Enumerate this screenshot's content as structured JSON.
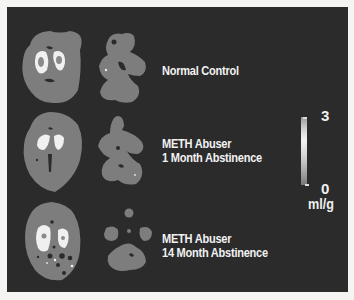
{
  "figure": {
    "background_color": "#2b2b2b",
    "tissue_color": "#7d7d7d",
    "high_uptake_color": "#f5f5f5",
    "rows": [
      {
        "label_line1": "Normal Control",
        "label_line2": ""
      },
      {
        "label_line1": "METH Abuser",
        "label_line2": "1 Month Abstinence"
      },
      {
        "label_line1": "METH Abuser",
        "label_line2": "14 Month Abstinence"
      }
    ],
    "colorbar": {
      "max_label": "3",
      "min_label": "0",
      "unit": "ml/g"
    }
  }
}
